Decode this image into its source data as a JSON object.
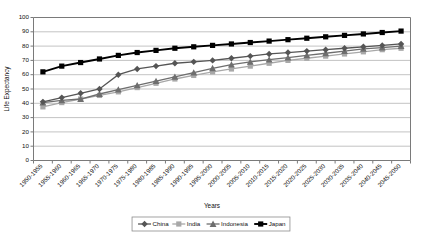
{
  "chart_data": {
    "type": "line",
    "title": "",
    "xlabel": "Years",
    "ylabel": "Life Expectancy",
    "ylim": [
      0,
      100
    ],
    "ytick_step": 10,
    "yticks": [
      "0",
      "10",
      "20",
      "30",
      "40",
      "50",
      "60",
      "70",
      "80",
      "90",
      "100"
    ],
    "grid": true,
    "legend_position": "bottom",
    "categories": [
      "1950-1955",
      "1955-1960",
      "1960-1965",
      "1965-1970",
      "1970-1975",
      "1975-1980",
      "1980-1985",
      "1985-1990",
      "1990-1995",
      "1995-2000",
      "2000-2005",
      "2005-2010",
      "2010-2015",
      "2015-2020",
      "2020-2025",
      "2025-2030",
      "2030-2035",
      "2035-2040",
      "2040-2045",
      "2045-2050"
    ],
    "series": [
      {
        "name": "China",
        "marker": "diamond",
        "color": "#555555",
        "values": [
          41,
          44,
          47,
          50,
          60,
          64,
          66,
          68,
          69,
          70,
          71.5,
          73,
          74.5,
          75.5,
          76.5,
          77.5,
          78.5,
          79.5,
          80.5,
          81.5
        ]
      },
      {
        "name": "India",
        "marker": "square",
        "color": "#a8a8a8",
        "values": [
          37.5,
          40.5,
          43,
          45.5,
          48,
          51,
          54,
          57,
          59.5,
          62,
          64,
          66,
          68,
          70,
          71.5,
          73,
          74.5,
          76,
          77.5,
          78.5
        ]
      },
      {
        "name": "Indonesia",
        "marker": "triangle",
        "color": "#6e6e6e",
        "values": [
          40.5,
          42,
          43,
          46.5,
          49.5,
          52.5,
          55.5,
          58.5,
          61.5,
          64.5,
          67,
          69,
          70.5,
          72,
          73.5,
          75,
          76.5,
          78,
          79,
          80
        ]
      },
      {
        "name": "Japan",
        "marker": "square",
        "color": "#000000",
        "values": [
          62,
          66,
          68.5,
          71,
          73.5,
          75.5,
          77,
          78.5,
          79.5,
          80.5,
          81.5,
          82.5,
          83.5,
          84.5,
          85.5,
          86.5,
          87.5,
          88.5,
          89.5,
          90.5
        ]
      }
    ],
    "legend": [
      "China",
      "India",
      "Indonesia",
      "Japan"
    ]
  },
  "axes": {
    "y_title": "Life Expectancy",
    "x_title": "Years"
  }
}
